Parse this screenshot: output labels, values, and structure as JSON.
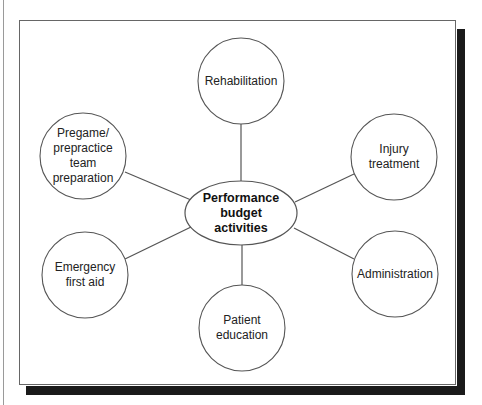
{
  "diagram": {
    "type": "hub-and-spoke",
    "center": {
      "label": "Performance\nbudget\nactivities",
      "cx": 241,
      "cy": 213,
      "rx": 56,
      "ry": 32
    },
    "nodes": [
      {
        "id": "rehabilitation",
        "label": "Rehabilitation",
        "cx": 241,
        "cy": 81,
        "r": 43
      },
      {
        "id": "pregame",
        "label": "Pregame/\nprepractice\nteam\npreparation",
        "cx": 83,
        "cy": 156,
        "r": 43
      },
      {
        "id": "injury-treatment",
        "label": "Injury\ntreatment",
        "cx": 394,
        "cy": 157,
        "r": 43
      },
      {
        "id": "emergency",
        "label": "Emergency\nfirst aid",
        "cx": 85,
        "cy": 275,
        "r": 43
      },
      {
        "id": "administration",
        "label": "Administration",
        "cx": 395,
        "cy": 274,
        "r": 43
      },
      {
        "id": "patient-education",
        "label": "Patient\neducation",
        "cx": 242,
        "cy": 328,
        "r": 43
      }
    ],
    "edges": [
      {
        "from": "center",
        "to": "rehabilitation",
        "x1": 241,
        "y1": 181,
        "x2": 241,
        "y2": 124
      },
      {
        "from": "center",
        "to": "pregame",
        "x1": 191,
        "y1": 200,
        "x2": 125,
        "y2": 172
      },
      {
        "from": "center",
        "to": "injury-treatment",
        "x1": 295,
        "y1": 202,
        "x2": 354,
        "y2": 174
      },
      {
        "from": "center",
        "to": "emergency",
        "x1": 191,
        "y1": 227,
        "x2": 125,
        "y2": 259
      },
      {
        "from": "center",
        "to": "administration",
        "x1": 294,
        "y1": 228,
        "x2": 354,
        "y2": 259
      },
      {
        "from": "center",
        "to": "patient-education",
        "x1": 242,
        "y1": 245,
        "x2": 242,
        "y2": 285
      }
    ],
    "colors": {
      "stroke": "#555555",
      "frame_shadow": "#1a1a1a",
      "text": "#222222"
    }
  }
}
